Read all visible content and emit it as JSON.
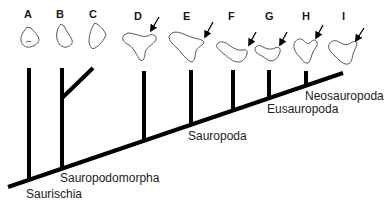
{
  "diagram": {
    "type": "cladogram",
    "taxa": [
      {
        "label": "A",
        "arrow": false
      },
      {
        "label": "B",
        "arrow": false
      },
      {
        "label": "C",
        "arrow": false
      },
      {
        "label": "D",
        "arrow": true
      },
      {
        "label": "E",
        "arrow": true
      },
      {
        "label": "F",
        "arrow": true
      },
      {
        "label": "G",
        "arrow": true
      },
      {
        "label": "H",
        "arrow": true
      },
      {
        "label": "I",
        "arrow": true
      }
    ],
    "clades": [
      {
        "label": "Saurischia"
      },
      {
        "label": "Sauropodomorpha"
      },
      {
        "label": "Sauropoda"
      },
      {
        "label": "Eusauropoda"
      },
      {
        "label": "Neosauropoda"
      }
    ],
    "colors": {
      "branch": "#000000",
      "outline": "#555555",
      "text": "#222222",
      "background": "#ffffff"
    }
  }
}
